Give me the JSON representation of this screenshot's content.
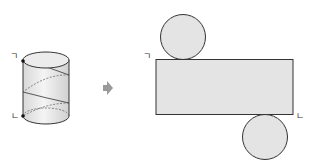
{
  "diagram": {
    "type": "cylinder-net",
    "labels": {
      "cylinder_top": "ㄱ",
      "cylinder_bottom": "ㄴ",
      "net_top": "ㄱ",
      "net_bottom": "ㄴ"
    },
    "arrow_icon": "right-arrow-icon",
    "colors": {
      "fill": "#e4e4e4",
      "stroke": "#333333",
      "arrow": "#9a9a9a"
    }
  }
}
